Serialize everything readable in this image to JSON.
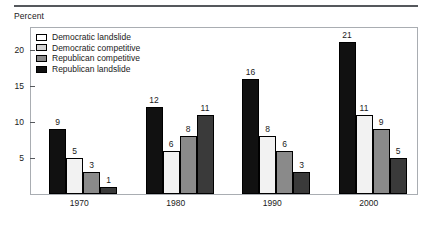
{
  "axis_title": "Percent",
  "legend": {
    "items": [
      {
        "label": "Democratic landslide",
        "color": "#ffffff"
      },
      {
        "label": "Democratic competitive",
        "color": "#d4d4d4"
      },
      {
        "label": "Republican competitive",
        "color": "#8a8a8a"
      },
      {
        "label": "Republican landslide",
        "color": "#111111"
      }
    ]
  },
  "chart_data": {
    "type": "bar",
    "title": "",
    "xlabel": "",
    "ylabel": "Percent",
    "ylim": [
      0,
      23
    ],
    "yticks": [
      5,
      10,
      15,
      20
    ],
    "ytick_labels": [
      "5",
      "10",
      "15",
      "20"
    ],
    "grid": false,
    "legend_position": "top-left",
    "categories": [
      "1970",
      "1980",
      "1990",
      "2000"
    ],
    "series": [
      {
        "name": "Republican landslide",
        "color": "#111111",
        "values": [
          9,
          12,
          16,
          21
        ]
      },
      {
        "name": "Democratic landslide",
        "color": "#f2f2f2",
        "values": [
          5,
          6,
          8,
          11
        ]
      },
      {
        "name": "Democratic competitive",
        "color": "#8a8a8a",
        "values": [
          3,
          8,
          6,
          9
        ]
      },
      {
        "name": "Republican competitive",
        "color": "#3a3a3a",
        "values": [
          1,
          11,
          3,
          5
        ]
      }
    ]
  }
}
